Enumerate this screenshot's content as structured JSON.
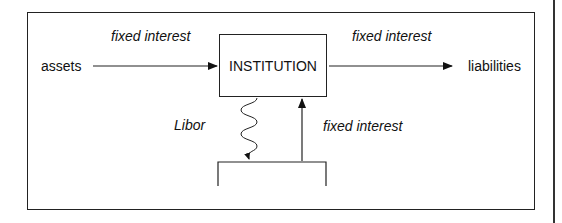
{
  "diagram": {
    "nodes": {
      "assets": "assets",
      "institution": "INSTITUTION",
      "liabilities": "liabilities"
    },
    "edges": {
      "assets_to_institution": "fixed interest",
      "institution_to_liabilities": "fixed interest",
      "institution_to_swap": "Libor",
      "swap_to_institution": "fixed interest"
    },
    "colors": {
      "line": "#222222",
      "background": "#ffffff"
    }
  }
}
